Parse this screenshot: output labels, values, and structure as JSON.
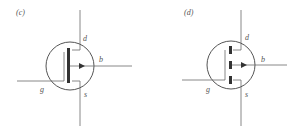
{
  "figures": [
    {
      "id": "c",
      "caption": "(c)",
      "symbol": "mosfet-depletion-continuous-channel",
      "terminals": {
        "drain": "d",
        "gate": "g",
        "source": "s",
        "body": "b"
      }
    },
    {
      "id": "d",
      "caption": "(d)",
      "symbol": "mosfet-enhancement-segmented-channel",
      "terminals": {
        "drain": "d",
        "gate": "g",
        "source": "s",
        "body": "b"
      }
    }
  ],
  "colors": {
    "line": "#6a6a6a",
    "channel": "#333333",
    "text": "#555555"
  }
}
